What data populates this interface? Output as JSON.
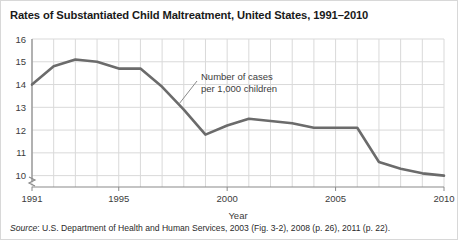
{
  "figure": {
    "title": "Rates of Substantiated Child Maltreatment, United States, 1991–2010",
    "source_label": "Source",
    "source_text": ": U.S. Department of Health and Human Services, 2003 (Fig. 3-2), 2008 (p. 26), 2011 (p. 22)."
  },
  "chart_data": {
    "type": "line",
    "title": "Rates of Substantiated Child Maltreatment, United States, 1991–2010",
    "xlabel": "Year",
    "ylabel": "",
    "xlim": [
      1991,
      2010
    ],
    "ylim": [
      9.5,
      16
    ],
    "grid": true,
    "legend": "none",
    "y_axis_break": true,
    "series_name": "Number of cases per 1,000 children",
    "annotation": {
      "line1": "Number of cases",
      "line2": "per 1,000 children"
    },
    "x": [
      1991,
      1992,
      1993,
      1994,
      1995,
      1996,
      1997,
      1998,
      1999,
      2000,
      2001,
      2002,
      2003,
      2004,
      2005,
      2006,
      2007,
      2008,
      2009,
      2010
    ],
    "values": [
      14.0,
      14.8,
      15.1,
      15.0,
      14.7,
      14.7,
      13.9,
      12.9,
      11.8,
      12.2,
      12.5,
      12.4,
      12.3,
      12.1,
      12.1,
      12.1,
      10.6,
      10.3,
      10.1,
      10.0
    ],
    "xticks": [
      1991,
      1995,
      2000,
      2005,
      2010
    ],
    "xtick_labels": [
      "1991",
      "1995",
      "2000",
      "2005",
      "2010"
    ],
    "yticks": [
      10,
      11,
      12,
      13,
      14,
      15,
      16
    ],
    "ytick_labels": [
      "10",
      "11",
      "12",
      "13",
      "14",
      "15",
      "16"
    ],
    "line_color": "#6b6b6b",
    "grid_color": "#d9d9d9",
    "axis_color": "#8a8a8a"
  }
}
